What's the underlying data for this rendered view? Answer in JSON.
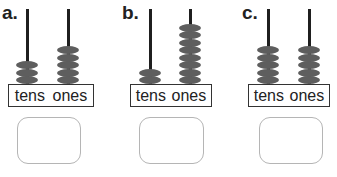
{
  "abaci": [
    {
      "letter": "a.",
      "tens_beads": 3,
      "ones_beads": 5,
      "labels": {
        "tens": "tens",
        "ones": "ones"
      },
      "answer": ""
    },
    {
      "letter": "b.",
      "tens_beads": 2,
      "ones_beads": 8,
      "labels": {
        "tens": "tens",
        "ones": "ones"
      },
      "answer": ""
    },
    {
      "letter": "c.",
      "tens_beads": 5,
      "ones_beads": 5,
      "labels": {
        "tens": "tens",
        "ones": "ones"
      },
      "answer": ""
    }
  ],
  "colors": {
    "bead": "#5e5e5e",
    "rod": "#1f1f1f",
    "label_border": "#333333",
    "answer_border": "#b5b5b5"
  }
}
